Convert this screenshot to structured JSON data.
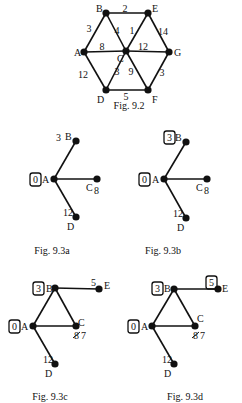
{
  "figures": [
    {
      "id": "fig-9-2",
      "caption": "Fig. 9.2",
      "caption_pos": [
        129,
        109
      ],
      "nodes": [
        {
          "id": "A",
          "x": 84,
          "y": 52,
          "label": "A",
          "lx": 74,
          "ly": 56
        },
        {
          "id": "B",
          "x": 106,
          "y": 13,
          "label": "B",
          "lx": 96,
          "ly": 12
        },
        {
          "id": "C",
          "x": 126,
          "y": 51,
          "label": "C",
          "lx": 117,
          "ly": 62
        },
        {
          "id": "D",
          "x": 106,
          "y": 90,
          "label": "D",
          "lx": 97,
          "ly": 103
        },
        {
          "id": "E",
          "x": 148,
          "y": 13,
          "label": "E",
          "lx": 152,
          "ly": 12
        },
        {
          "id": "F",
          "x": 148,
          "y": 90,
          "label": "F",
          "lx": 152,
          "ly": 103
        },
        {
          "id": "G",
          "x": 169,
          "y": 52,
          "label": "G",
          "lx": 174,
          "ly": 56
        }
      ],
      "edges": [
        {
          "from": "A",
          "to": "B",
          "w": "3",
          "wx": 89,
          "wy": 32
        },
        {
          "from": "A",
          "to": "C",
          "w": "8",
          "wx": 102,
          "wy": 50
        },
        {
          "from": "A",
          "to": "D",
          "w": "12",
          "wx": 83,
          "wy": 78
        },
        {
          "from": "B",
          "to": "E",
          "w": "2",
          "wx": 125,
          "wy": 12
        },
        {
          "from": "B",
          "to": "C",
          "w": "4",
          "wx": 117,
          "wy": 34
        },
        {
          "from": "E",
          "to": "C",
          "w": "1",
          "wx": 132,
          "wy": 34
        },
        {
          "from": "E",
          "to": "G",
          "w": "14",
          "wx": 163,
          "wy": 35
        },
        {
          "from": "C",
          "to": "G",
          "w": "12",
          "wx": 143,
          "wy": 50
        },
        {
          "from": "D",
          "to": "C",
          "w": "3",
          "wx": 117,
          "wy": 75
        },
        {
          "from": "C",
          "to": "F",
          "w": "9",
          "wx": 131,
          "wy": 75
        },
        {
          "from": "G",
          "to": "F",
          "w": "3",
          "wx": 162,
          "wy": 76
        },
        {
          "from": "D",
          "to": "F",
          "w": "5",
          "wx": 126,
          "wy": 100
        }
      ],
      "extra_labels": []
    },
    {
      "id": "fig-9-3a",
      "caption": "Fig. 9.3a",
      "caption_pos": [
        52,
        254
      ],
      "nodes": [
        {
          "id": "A",
          "x": 54,
          "y": 179,
          "label": "A",
          "lx": 42,
          "ly": 183
        },
        {
          "id": "B",
          "x": 76,
          "y": 141,
          "label": "B",
          "lx": 65,
          "ly": 140
        },
        {
          "id": "C",
          "x": 97,
          "y": 179,
          "label": "C",
          "lx": 86,
          "ly": 191
        },
        {
          "id": "D",
          "x": 76,
          "y": 217,
          "label": "D",
          "lx": 67,
          "ly": 230
        }
      ],
      "edges": [
        {
          "from": "A",
          "to": "B"
        },
        {
          "from": "A",
          "to": "C"
        },
        {
          "from": "A",
          "to": "D"
        }
      ],
      "extra_labels": [
        {
          "text": "3",
          "x": 56,
          "y": 141,
          "boxed": false
        },
        {
          "text": "0",
          "x": 33,
          "y": 183,
          "boxed": true
        },
        {
          "text": "8",
          "x": 94,
          "y": 194,
          "boxed": false
        },
        {
          "text": "12",
          "x": 63,
          "y": 216,
          "boxed": false
        }
      ]
    },
    {
      "id": "fig-9-3b",
      "caption": "Fig. 9.3b",
      "caption_pos": [
        163,
        254
      ],
      "nodes": [
        {
          "id": "A",
          "x": 164,
          "y": 179,
          "label": "A",
          "lx": 152,
          "ly": 183
        },
        {
          "id": "B",
          "x": 186,
          "y": 142,
          "label": "B",
          "lx": 175,
          "ly": 141
        },
        {
          "id": "C",
          "x": 207,
          "y": 179,
          "label": "C",
          "lx": 196,
          "ly": 191
        },
        {
          "id": "D",
          "x": 186,
          "y": 218,
          "label": "D",
          "lx": 177,
          "ly": 231
        }
      ],
      "edges": [
        {
          "from": "A",
          "to": "B"
        },
        {
          "from": "A",
          "to": "C"
        },
        {
          "from": "A",
          "to": "D"
        }
      ],
      "extra_labels": [
        {
          "text": "3",
          "x": 167,
          "y": 141,
          "boxed": true
        },
        {
          "text": "0",
          "x": 142,
          "y": 183,
          "boxed": true
        },
        {
          "text": "8",
          "x": 204,
          "y": 194,
          "boxed": false
        },
        {
          "text": "12",
          "x": 173,
          "y": 217,
          "boxed": false
        }
      ]
    },
    {
      "id": "fig-9-3c",
      "caption": "Fig. 9.3c",
      "caption_pos": [
        50,
        400
      ],
      "nodes": [
        {
          "id": "A",
          "x": 33,
          "y": 326,
          "label": "A",
          "lx": 21,
          "ly": 330
        },
        {
          "id": "B",
          "x": 55,
          "y": 288,
          "label": "B",
          "lx": 46,
          "ly": 292
        },
        {
          "id": "C",
          "x": 76,
          "y": 326,
          "label": "C",
          "lx": 78,
          "ly": 326
        },
        {
          "id": "D",
          "x": 55,
          "y": 364,
          "label": "D",
          "lx": 45,
          "ly": 377
        },
        {
          "id": "E",
          "x": 99,
          "y": 289,
          "label": "E",
          "lx": 104,
          "ly": 289
        }
      ],
      "edges": [
        {
          "from": "A",
          "to": "B"
        },
        {
          "from": "A",
          "to": "C"
        },
        {
          "from": "A",
          "to": "D"
        },
        {
          "from": "B",
          "to": "C"
        },
        {
          "from": "B",
          "to": "E"
        }
      ],
      "extra_labels": [
        {
          "text": "3",
          "x": 36,
          "y": 292,
          "boxed": true
        },
        {
          "text": "0",
          "x": 12,
          "y": 330,
          "boxed": true
        },
        {
          "text": "8",
          "x": 74,
          "y": 339,
          "boxed": false,
          "struck": true
        },
        {
          "text": "7",
          "x": 81,
          "y": 339,
          "boxed": false
        },
        {
          "text": "5",
          "x": 91,
          "y": 286,
          "boxed": false
        },
        {
          "text": "12",
          "x": 43,
          "y": 363,
          "boxed": false
        }
      ]
    },
    {
      "id": "fig-9-3d",
      "caption": "Fig. 9.3d",
      "caption_pos": [
        185,
        400
      ],
      "nodes": [
        {
          "id": "A",
          "x": 152,
          "y": 326,
          "label": "A",
          "lx": 141,
          "ly": 330
        },
        {
          "id": "B",
          "x": 174,
          "y": 289,
          "label": "B",
          "lx": 164,
          "ly": 292
        },
        {
          "id": "C",
          "x": 195,
          "y": 326,
          "label": "C",
          "lx": 197,
          "ly": 322
        },
        {
          "id": "D",
          "x": 174,
          "y": 364,
          "label": "D",
          "lx": 164,
          "ly": 377
        },
        {
          "id": "E",
          "x": 218,
          "y": 289,
          "label": "E",
          "lx": 222,
          "ly": 292
        }
      ],
      "edges": [
        {
          "from": "A",
          "to": "B"
        },
        {
          "from": "A",
          "to": "C"
        },
        {
          "from": "A",
          "to": "D"
        },
        {
          "from": "B",
          "to": "C"
        },
        {
          "from": "B",
          "to": "E"
        }
      ],
      "extra_labels": [
        {
          "text": "3",
          "x": 155,
          "y": 292,
          "boxed": true
        },
        {
          "text": "0",
          "x": 131,
          "y": 330,
          "boxed": true
        },
        {
          "text": "5",
          "x": 209,
          "y": 286,
          "boxed": true
        },
        {
          "text": "8",
          "x": 193,
          "y": 339,
          "boxed": false,
          "struck": true
        },
        {
          "text": "7",
          "x": 200,
          "y": 339,
          "boxed": false
        },
        {
          "text": "12",
          "x": 162,
          "y": 363,
          "boxed": false
        }
      ]
    }
  ]
}
